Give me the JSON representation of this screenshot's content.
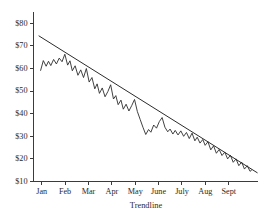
{
  "chart_data": {
    "type": "line",
    "title": "",
    "subtitle": "",
    "xlabel": "Trendline",
    "ylabel": "",
    "grid": false,
    "legend": "none",
    "xlim": [
      0,
      9.6
    ],
    "ylim": [
      10,
      85
    ],
    "y_ticks": [
      10,
      20,
      30,
      40,
      50,
      60,
      70,
      80
    ],
    "y_tick_labels": [
      "$10",
      "$20",
      "$30",
      "$40",
      "$50",
      "$60",
      "$70",
      "$80"
    ],
    "categories": [
      "Jan",
      "Feb",
      "Mar",
      "Apr",
      "May",
      "June",
      "July",
      "Aug",
      "Sept"
    ],
    "x_tick_positions": [
      0.35,
      1.35,
      2.35,
      3.35,
      4.35,
      5.35,
      6.35,
      7.35,
      8.35
    ],
    "series": [
      {
        "name": "Price",
        "type": "line",
        "points": [
          [
            0.3,
            59.0
          ],
          [
            0.42,
            63.5
          ],
          [
            0.54,
            61.0
          ],
          [
            0.64,
            63.2
          ],
          [
            0.74,
            61.3
          ],
          [
            0.86,
            64.0
          ],
          [
            0.98,
            62.0
          ],
          [
            1.1,
            64.6
          ],
          [
            1.22,
            63.0
          ],
          [
            1.34,
            66.3
          ],
          [
            1.46,
            61.5
          ],
          [
            1.56,
            63.4
          ],
          [
            1.66,
            59.0
          ],
          [
            1.78,
            61.2
          ],
          [
            1.9,
            57.0
          ],
          [
            2.02,
            59.4
          ],
          [
            2.14,
            56.0
          ],
          [
            2.26,
            60.0
          ],
          [
            2.38,
            54.0
          ],
          [
            2.5,
            56.0
          ],
          [
            2.62,
            51.0
          ],
          [
            2.72,
            53.2
          ],
          [
            2.82,
            49.0
          ],
          [
            2.94,
            51.4
          ],
          [
            3.06,
            47.5
          ],
          [
            3.18,
            49.8
          ],
          [
            3.3,
            52.8
          ],
          [
            3.42,
            46.5
          ],
          [
            3.52,
            48.0
          ],
          [
            3.62,
            44.0
          ],
          [
            3.74,
            46.0
          ],
          [
            3.84,
            42.0
          ],
          [
            3.96,
            44.2
          ],
          [
            4.08,
            41.2
          ],
          [
            4.2,
            43.6
          ],
          [
            4.32,
            46.3
          ],
          [
            4.44,
            41.0
          ],
          [
            4.56,
            37.5
          ],
          [
            4.68,
            34.0
          ],
          [
            4.8,
            30.8
          ],
          [
            4.92,
            33.0
          ],
          [
            5.02,
            31.8
          ],
          [
            5.14,
            35.0
          ],
          [
            5.26,
            33.6
          ],
          [
            5.38,
            36.5
          ],
          [
            5.5,
            38.3
          ],
          [
            5.62,
            34.0
          ],
          [
            5.74,
            32.0
          ],
          [
            5.84,
            33.2
          ],
          [
            5.96,
            31.0
          ],
          [
            6.06,
            32.6
          ],
          [
            6.18,
            30.6
          ],
          [
            6.3,
            32.4
          ],
          [
            6.42,
            30.0
          ],
          [
            6.54,
            31.7
          ],
          [
            6.66,
            29.0
          ],
          [
            6.78,
            31.4
          ],
          [
            6.9,
            28.0
          ],
          [
            7.0,
            29.6
          ],
          [
            7.12,
            27.0
          ],
          [
            7.24,
            28.6
          ],
          [
            7.34,
            26.0
          ],
          [
            7.46,
            27.6
          ],
          [
            7.58,
            24.0
          ],
          [
            7.7,
            25.8
          ],
          [
            7.82,
            22.5
          ],
          [
            7.94,
            24.2
          ],
          [
            8.06,
            21.5
          ],
          [
            8.18,
            23.0
          ],
          [
            8.3,
            20.0
          ],
          [
            8.42,
            21.6
          ],
          [
            8.54,
            18.5
          ],
          [
            8.66,
            20.0
          ],
          [
            8.78,
            17.0
          ],
          [
            8.9,
            18.6
          ],
          [
            9.02,
            15.5
          ],
          [
            9.14,
            17.0
          ],
          [
            9.26,
            14.5
          ],
          [
            9.34,
            15.2
          ]
        ]
      }
    ],
    "annotations": [
      {
        "name": "trendline",
        "type": "line",
        "from": [
          0.22,
          74.5
        ],
        "to": [
          9.58,
          13.8
        ],
        "label": "Trendline"
      }
    ]
  }
}
